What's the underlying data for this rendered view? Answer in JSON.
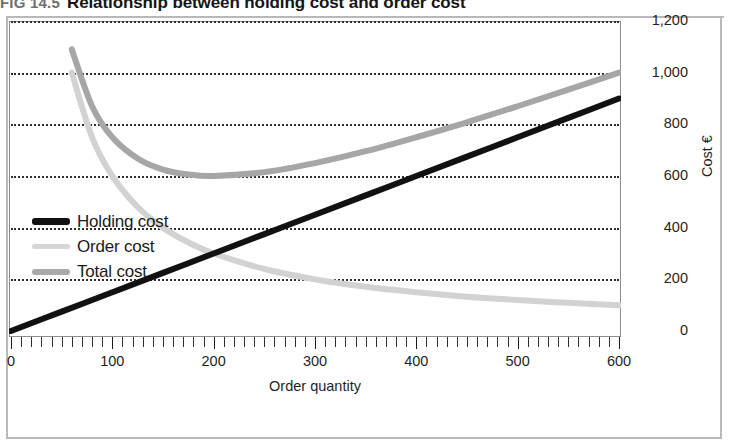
{
  "figure": {
    "number": "FIG 14.5",
    "title": "Relationship between holding cost and order cost"
  },
  "chart_data": {
    "type": "line",
    "title": "Relationship between holding cost and order cost",
    "xlabel": "Order quantity",
    "ylabel": "Cost €",
    "xlim": [
      0,
      600
    ],
    "ylim": [
      0,
      1200
    ],
    "x_ticks": [
      0,
      100,
      200,
      300,
      400,
      500,
      600
    ],
    "x_tick_labels": [
      "0",
      "100",
      "200",
      "300",
      "400",
      "500",
      "600"
    ],
    "x_minor_tick_step": 10,
    "y_ticks": [
      0,
      200,
      400,
      600,
      800,
      1000,
      1200
    ],
    "y_tick_labels": [
      "0",
      "200",
      "400",
      "600",
      "800",
      "1,000",
      "1,200"
    ],
    "grid": "horizontal-dotted",
    "legend_position": "left-middle",
    "series": [
      {
        "name": "Holding cost",
        "color": "#111111",
        "width": 6,
        "x": [
          0,
          50,
          100,
          150,
          200,
          250,
          300,
          350,
          400,
          450,
          500,
          550,
          600
        ],
        "values": [
          0,
          75,
          150,
          225,
          300,
          375,
          450,
          525,
          600,
          675,
          750,
          825,
          900
        ]
      },
      {
        "name": "Order cost",
        "color": "#d2d2d2",
        "width": 6,
        "x": [
          60,
          80,
          100,
          125,
          150,
          175,
          200,
          250,
          300,
          350,
          400,
          450,
          500,
          550,
          600
        ],
        "values": [
          1000,
          750,
          600,
          480,
          400,
          343,
          300,
          240,
          200,
          171,
          150,
          133,
          120,
          109,
          100
        ]
      },
      {
        "name": "Total cost",
        "color": "#a6a6a6",
        "width": 6,
        "x": [
          60,
          80,
          100,
          125,
          150,
          175,
          200,
          250,
          300,
          350,
          400,
          450,
          500,
          550,
          600
        ],
        "values": [
          1090,
          870,
          750,
          668,
          625,
          606,
          600,
          615,
          650,
          696,
          750,
          808,
          870,
          934,
          1000
        ]
      }
    ]
  },
  "legend": {
    "items": [
      {
        "label": "Holding cost",
        "color": "#111111",
        "thickness": "7px"
      },
      {
        "label": "Order cost",
        "color": "#d6d6d6",
        "thickness": "5px"
      },
      {
        "label": "Total cost",
        "color": "#a9a9a9",
        "thickness": "6px"
      }
    ]
  }
}
